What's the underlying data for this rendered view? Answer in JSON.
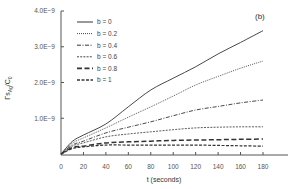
{
  "chart_data": {
    "type": "line",
    "title": "",
    "panel_label": "(b)",
    "xlabel": "t (seconds)",
    "ylabel": "Γs_Ag/C₀",
    "ylabel_parts": {
      "main": "Γs",
      "sub1": "Ag",
      "mid": "/C",
      "sub2": "0"
    },
    "xlim": [
      0,
      190
    ],
    "ylim": [
      0,
      4e-09
    ],
    "x_ticks": [
      0,
      20,
      40,
      60,
      80,
      100,
      120,
      140,
      160,
      180
    ],
    "x_tick_labels": [
      "0",
      "20",
      "40",
      "60",
      "80",
      "100",
      "120",
      "140",
      "160",
      "180"
    ],
    "y_ticks": [
      1e-09,
      2e-09,
      3e-09,
      4e-09
    ],
    "y_tick_labels": [
      "1.0E−9",
      "2.0E−9",
      "3.0E−9",
      "4.0E−9"
    ],
    "grid": false,
    "legend_position": "upper left",
    "x": [
      0,
      10,
      20,
      40,
      60,
      80,
      100,
      120,
      140,
      160,
      180
    ],
    "series": [
      {
        "name": "b = 0",
        "style": "solid",
        "values": [
          0,
          3.5e-10,
          5.3e-10,
          8.4e-10,
          1.32e-09,
          1.79e-09,
          2.12e-09,
          2.44e-09,
          2.8e-09,
          3.12e-09,
          3.45e-09
        ]
      },
      {
        "name": "b = 0.2",
        "style": "dotted",
        "values": [
          0,
          3e-10,
          4.5e-10,
          7.3e-10,
          1.03e-09,
          1.32e-09,
          1.62e-09,
          1.93e-09,
          2.17e-09,
          2.4e-09,
          2.6e-09
        ]
      },
      {
        "name": "b = 0.4",
        "style": "dashdot",
        "values": [
          0,
          2.5e-10,
          3.6e-10,
          5.9e-10,
          7.5e-10,
          9e-10,
          1.07e-09,
          1.23e-09,
          1.33e-09,
          1.43e-09,
          1.51e-09
        ]
      },
      {
        "name": "b = 0.6",
        "style": "shortdash",
        "values": [
          0,
          2.2e-10,
          3.1e-10,
          4.8e-10,
          5.6e-10,
          6.2e-10,
          6.8e-10,
          7.3e-10,
          7.5e-10,
          7.6e-10,
          7.6e-10
        ]
      },
      {
        "name": "b = 0.8",
        "style": "longdash",
        "values": [
          0,
          1.8e-10,
          2.2e-10,
          3.1e-10,
          3.4e-10,
          3.6e-10,
          3.8e-10,
          3.9e-10,
          4e-10,
          4.1e-10,
          4.2e-10
        ]
      },
      {
        "name": "b = 1",
        "style": "dash",
        "values": [
          0,
          1.5e-10,
          2e-10,
          2.5e-10,
          2.5e-10,
          2.5e-10,
          2.5e-10,
          2.5e-10,
          2.4e-10,
          2.3e-10,
          2.2e-10
        ]
      }
    ]
  },
  "colors": {
    "axis": "#555555",
    "line": "#333333",
    "background": "#ffffff"
  }
}
